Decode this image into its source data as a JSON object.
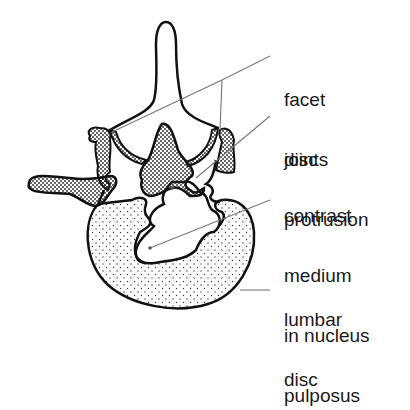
{
  "figure": {
    "labels": [
      {
        "id": "facet-joints",
        "lines": [
          "facet",
          "joints"
        ]
      },
      {
        "id": "disc-protrusion",
        "lines": [
          "disc",
          "protrusion"
        ]
      },
      {
        "id": "contrast-medium",
        "lines": [
          "contrast",
          "medium",
          "in nucleus",
          "pulposus"
        ]
      },
      {
        "id": "lumbar-disc",
        "lines": [
          "lumbar",
          "disc"
        ]
      }
    ]
  },
  "colors": {
    "stroke": "#111111",
    "leader": "#777777",
    "stipple": "#222222",
    "background": "#ffffff"
  }
}
